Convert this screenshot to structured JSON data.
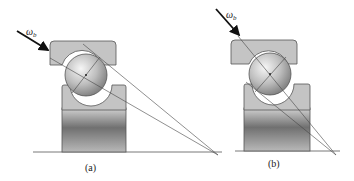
{
  "figure": {
    "panels": [
      {
        "id": "a",
        "caption": "(a)",
        "load_symbol": "ω",
        "load_subscript": "b",
        "description": "angular contact ball bearing, load applied at shallow angle"
      },
      {
        "id": "b",
        "caption": "(b)",
        "load_symbol": "ω",
        "load_subscript": "b",
        "description": "angular contact ball bearing, load applied at steep angle along contact line"
      }
    ],
    "colors": {
      "ring_fill": "#c4c4c4",
      "ring_stroke": "#555555",
      "housing_dark": "#6a6a6a",
      "housing_light": "#c8c8c8",
      "ball_light": "#f2f2f2",
      "ball_dark": "#8a8a8a",
      "line": "#444444",
      "arrow": "#111111"
    }
  }
}
